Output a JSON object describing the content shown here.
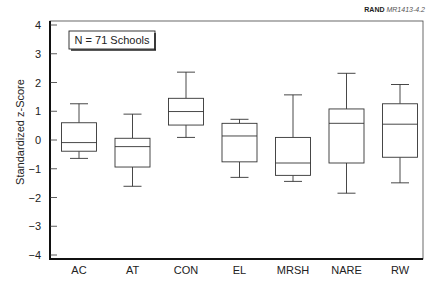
{
  "credit": {
    "org": "RAND",
    "code": "MR1413-4.2"
  },
  "chart_data": {
    "type": "box",
    "title": "",
    "annotation": "N = 71 Schools",
    "xlabel": "",
    "ylabel": "Standardized z-Score",
    "ylim": [
      -4,
      4
    ],
    "yticks": [
      -4,
      -3,
      -2,
      -1,
      0,
      1,
      2,
      3,
      4
    ],
    "categories": [
      "AC",
      "AT",
      "CON",
      "EL",
      "MRSH",
      "NARE",
      "RW"
    ],
    "boxes": [
      {
        "name": "AC",
        "whisker_low": -0.64,
        "q1": -0.39,
        "median": -0.09,
        "q3": 0.6,
        "whisker_high": 1.26
      },
      {
        "name": "AT",
        "whisker_low": -1.61,
        "q1": -0.94,
        "median": -0.23,
        "q3": 0.06,
        "whisker_high": 0.9
      },
      {
        "name": "CON",
        "whisker_low": 0.09,
        "q1": 0.52,
        "median": 0.99,
        "q3": 1.45,
        "whisker_high": 2.36
      },
      {
        "name": "EL",
        "whisker_low": -1.3,
        "q1": -0.76,
        "median": 0.14,
        "q3": 0.58,
        "whisker_high": 0.72
      },
      {
        "name": "MRSH",
        "whisker_low": -1.44,
        "q1": -1.23,
        "median": -0.8,
        "q3": 0.09,
        "whisker_high": 1.57
      },
      {
        "name": "NARE",
        "whisker_low": -1.85,
        "q1": -0.8,
        "median": 0.58,
        "q3": 1.08,
        "whisker_high": 2.32
      },
      {
        "name": "RW",
        "whisker_low": -1.49,
        "q1": -0.6,
        "median": 0.55,
        "q3": 1.26,
        "whisker_high": 1.93
      }
    ],
    "grid": false,
    "legend": null
  }
}
